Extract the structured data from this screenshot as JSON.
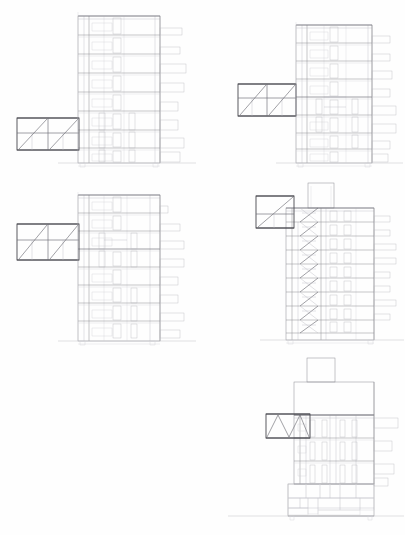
{
  "sheet": {
    "title": "Building Section Study Sheet",
    "description": "Architectural sheet of five multi-storey building cross-sections with cantilevered truss structures",
    "background_color": "#ffffff",
    "line_color": "#8d8d93",
    "heavy_line_color": "#4a4a50",
    "width_px": 405,
    "height_px": 535
  },
  "drawings": [
    {
      "id": "section-1",
      "name": "section-top-left",
      "position": {
        "x": 8,
        "y": 8,
        "width": 190,
        "height": 172
      },
      "storeys": 8,
      "truss": {
        "type": "diagonal",
        "bays": 2,
        "chords": 3,
        "side": "left",
        "attach_level": 5,
        "x": 8,
        "y": 110,
        "width": 70,
        "height": 40
      },
      "balcony_count": 8,
      "balcony_side": "right",
      "ground_line_y": 163,
      "core_visible": true
    },
    {
      "id": "section-2",
      "name": "section-top-right",
      "position": {
        "x": 238,
        "y": 8,
        "width": 164,
        "height": 172
      },
      "storeys": 8,
      "truss": {
        "type": "diagonal",
        "bays": 2,
        "chords": 3,
        "side": "left",
        "attach_level": 4,
        "x": 238,
        "y": 84,
        "width": 66,
        "height": 34
      },
      "balcony_count": 8,
      "balcony_side": "right",
      "ground_line_y": 163,
      "core_visible": true
    },
    {
      "id": "section-3",
      "name": "section-middle-left",
      "position": {
        "x": 8,
        "y": 190,
        "width": 190,
        "height": 160
      },
      "storeys": 8,
      "truss": {
        "type": "diagonal",
        "bays": 2,
        "chords": 3,
        "side": "left",
        "attach_level": 3,
        "x": 8,
        "y": 224,
        "width": 70,
        "height": 40
      },
      "balcony_count": 8,
      "balcony_side": "right",
      "ground_line_y": 336,
      "core_visible": true
    },
    {
      "id": "section-4",
      "name": "section-middle-right",
      "position": {
        "x": 238,
        "y": 182,
        "width": 164,
        "height": 168
      },
      "storeys": 9,
      "truss": {
        "type": "diagonal",
        "bays": 1,
        "chords": 2,
        "side": "left",
        "attach_level": 8,
        "x": 256,
        "y": 196,
        "width": 44,
        "height": 34
      },
      "stair": {
        "type": "zigzag-scissor",
        "flights": 9,
        "x": 300,
        "y": 212,
        "width": 22,
        "height": 128
      },
      "roof_box": {
        "x": 310,
        "y": 183,
        "width": 24,
        "height": 24
      },
      "balcony_count": 7,
      "balcony_side": "right",
      "ground_line_y": 340,
      "core_visible": true
    },
    {
      "id": "section-5",
      "name": "section-bottom-right",
      "position": {
        "x": 262,
        "y": 358,
        "width": 140,
        "height": 170
      },
      "storeys": 4,
      "truss": {
        "type": "zigzag",
        "bays": 3,
        "chords": 2,
        "side": "left",
        "attach_level": 4,
        "x": 266,
        "y": 416,
        "width": 44,
        "height": 26
      },
      "roof_box": {
        "x": 307,
        "y": 360,
        "width": 26,
        "height": 22
      },
      "balcony_count": 4,
      "balcony_side": "right",
      "ground_line_y": 516,
      "plinth": {
        "label": "base-elevation-detail",
        "x": 288,
        "y": 484,
        "width": 82,
        "height": 32,
        "shading": "dark-hatched"
      },
      "core_visible": true
    }
  ],
  "legend": {
    "drawing_type": "cross-section",
    "scale_note": "",
    "sheet_note": ""
  }
}
